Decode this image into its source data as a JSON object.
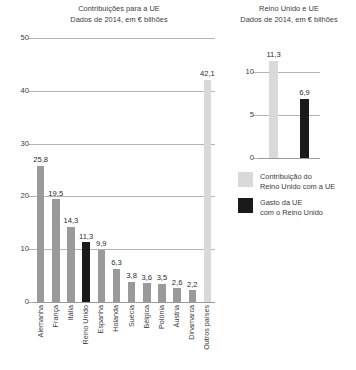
{
  "colors": {
    "bar_gray": "#9a9a9a",
    "bar_black": "#1a1a1a",
    "bar_light": "#d9d9d9",
    "gridline": "#b4b4b4",
    "text": "#3b3b3b"
  },
  "left": {
    "title_line1": "Contribuições para a UE",
    "title_line2": "Dados de 2014, em € bilhões"
  },
  "right": {
    "title_line1": "Reino Unido e UE",
    "title_line2": "Dados de 2014, em € bilhões"
  },
  "legend": {
    "items": [
      {
        "swatch": "#d9d9d9",
        "line1": "Contribuição do",
        "line2": "Reino Unido com a UE"
      },
      {
        "swatch": "#1a1a1a",
        "line1": "Gasto da UE",
        "line2": "com o Reino Unido"
      }
    ]
  },
  "chart_data": [
    {
      "type": "bar",
      "id": "contribuicoes-para-a-ue",
      "title": "Contribuições para a UE",
      "subtitle": "Dados de 2014, em € bilhões",
      "xlabel": "",
      "ylabel": "",
      "ylim": [
        0,
        50
      ],
      "yticks": [
        0,
        10,
        20,
        30,
        40,
        50
      ],
      "ytick_labels": [
        "0",
        "10",
        "20",
        "30",
        "40",
        "50"
      ],
      "grid": true,
      "legend": false,
      "categories": [
        "Alemanha",
        "França",
        "Itália",
        "Reino Unido",
        "Espanha",
        "Holanda",
        "Suécia",
        "Bélgica",
        "Polónia",
        "Áustria",
        "Dinamarca",
        "Outros países"
      ],
      "values": [
        25.8,
        19.5,
        14.3,
        11.3,
        9.9,
        6.3,
        3.8,
        3.6,
        3.5,
        2.6,
        2.2,
        42.1
      ],
      "value_labels": [
        "25,8",
        "19,5",
        "14,3",
        "11,3",
        "9,9",
        "6,3",
        "3,8",
        "3,6",
        "3,5",
        "2,6",
        "2,2",
        "42,1"
      ],
      "bar_colors": [
        "#9a9a9a",
        "#9a9a9a",
        "#9a9a9a",
        "#1a1a1a",
        "#9a9a9a",
        "#9a9a9a",
        "#9a9a9a",
        "#9a9a9a",
        "#9a9a9a",
        "#9a9a9a",
        "#9a9a9a",
        "#d9d9d9"
      ]
    },
    {
      "type": "bar",
      "id": "reino-unido-e-ue",
      "title": "Reino Unido e UE",
      "subtitle": "Dados de 2014, em € bilhões",
      "xlabel": "",
      "ylabel": "",
      "ylim": [
        0,
        12.55
      ],
      "yticks": [
        0,
        5,
        10
      ],
      "ytick_labels": [
        "0",
        "5",
        "10"
      ],
      "grid": true,
      "legend": true,
      "categories": [
        "Contribuição do Reino Unido com a UE",
        "Gasto da UE com o Reino Unido"
      ],
      "values": [
        11.3,
        6.9
      ],
      "value_labels": [
        "11,3",
        "6,9"
      ],
      "bar_colors": [
        "#d9d9d9",
        "#1a1a1a"
      ]
    }
  ]
}
